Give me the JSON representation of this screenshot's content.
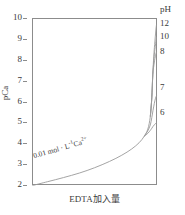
{
  "chart_data": {
    "type": "line",
    "title": "",
    "xlabel": "EDTA加入量",
    "ylabel": "pCa",
    "ylim": [
      2,
      10
    ],
    "y_ticks": [
      10,
      9,
      8,
      7,
      6,
      5,
      4,
      3,
      2
    ],
    "x_ticks": [],
    "grid": false,
    "right_axis": {
      "label": "pH",
      "ticks": [
        "12",
        "10",
        "8",
        "7",
        "6"
      ],
      "tick_pCa_values": [
        9.7,
        9.1,
        8.4,
        6.3,
        5.0
      ]
    },
    "legend_position": "right-axis-end-labels",
    "annotations": [
      {
        "text_plain": "0.01 mol · L-1Ca2+",
        "prefix": "0.01 mol · L",
        "sup1": "-1",
        "mid": "Ca",
        "sup2": "2+",
        "rotation_deg": -16
      }
    ],
    "series": [
      {
        "name": "pH 12",
        "end_label": "12",
        "end_pCa": 9.7,
        "x": [
          0,
          0.12,
          0.25,
          0.38,
          0.5,
          0.62,
          0.72,
          0.8,
          0.86,
          0.9,
          0.93,
          0.95,
          0.962,
          0.97,
          0.978,
          0.985,
          0.995,
          1.0
        ],
        "y": [
          2.0,
          2.18,
          2.38,
          2.6,
          2.85,
          3.15,
          3.45,
          3.75,
          4.05,
          4.35,
          4.7,
          5.3,
          6.2,
          7.3,
          8.2,
          8.75,
          9.45,
          9.7
        ]
      },
      {
        "name": "pH 10",
        "end_label": "10",
        "end_pCa": 9.1,
        "x": [
          0.95,
          0.962,
          0.97,
          0.978,
          0.985,
          0.995,
          1.0
        ],
        "y": [
          5.3,
          6.2,
          7.3,
          7.95,
          8.4,
          8.9,
          9.1
        ]
      },
      {
        "name": "pH 8",
        "end_label": "8",
        "end_pCa": 8.4,
        "x": [
          0.95,
          0.962,
          0.97,
          0.978,
          0.985,
          0.995,
          1.0
        ],
        "y": [
          5.3,
          6.2,
          7.3,
          7.72,
          8.0,
          8.3,
          8.4
        ]
      },
      {
        "name": "pH 7",
        "end_label": "7",
        "end_pCa": 6.3,
        "x": [
          0.9,
          0.93,
          0.95,
          0.962,
          0.972,
          0.982,
          0.992,
          1.0
        ],
        "y": [
          4.35,
          4.62,
          4.9,
          5.25,
          5.6,
          5.92,
          6.18,
          6.3
        ]
      },
      {
        "name": "pH 6",
        "end_label": "6",
        "end_pCa": 5.0,
        "x": [
          0.9,
          0.93,
          0.95,
          0.962,
          0.972,
          0.982,
          0.992,
          1.0
        ],
        "y": [
          4.35,
          4.5,
          4.64,
          4.74,
          4.83,
          4.9,
          4.97,
          5.0
        ]
      }
    ]
  },
  "axes": {
    "y": {
      "title": "pCa",
      "ticks": [
        {
          "label": "10"
        },
        {
          "label": "9"
        },
        {
          "label": "8"
        },
        {
          "label": "7"
        },
        {
          "label": "6"
        },
        {
          "label": "5"
        },
        {
          "label": "4"
        },
        {
          "label": "3"
        },
        {
          "label": "2"
        }
      ]
    },
    "x": {
      "title": "EDTA加入量"
    },
    "right": {
      "title": "pH",
      "labels": [
        {
          "label": "12"
        },
        {
          "label": "10"
        },
        {
          "label": "8"
        },
        {
          "label": "7"
        },
        {
          "label": "6"
        }
      ]
    }
  },
  "annotation": {
    "prefix": "0.01 mol · L",
    "sup1": "-1",
    "mid": "Ca",
    "sup2": "2+"
  },
  "colors": {
    "curve": "#9a9a9a",
    "frame": "#8c8c8c",
    "text": "#3a3a3a",
    "background": "#ffffff"
  }
}
